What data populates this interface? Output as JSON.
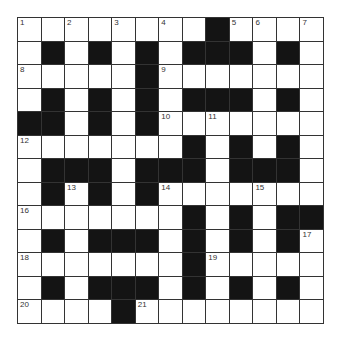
{
  "puzzle": {
    "rows": 13,
    "cols": 13,
    "grid": [
      "........#....",
      ".#.#.#.###.#.",
      ".....#.......",
      ".#.#.#.###.#.",
      "##.#.#.......",
      ".......#.#.#.",
      ".###.###.###.",
      ".#.#.#.......",
      ".......#.#.##",
      ".#.###.#.#.#.",
      ".......#.....",
      ".#.###.#.#.#.",
      "....#........"
    ],
    "numbers": [
      {
        "r": 0,
        "c": 0,
        "n": "1"
      },
      {
        "r": 0,
        "c": 2,
        "n": "2"
      },
      {
        "r": 0,
        "c": 4,
        "n": "3"
      },
      {
        "r": 0,
        "c": 6,
        "n": "4"
      },
      {
        "r": 0,
        "c": 9,
        "n": "5"
      },
      {
        "r": 0,
        "c": 10,
        "n": "6"
      },
      {
        "r": 0,
        "c": 12,
        "n": "7"
      },
      {
        "r": 2,
        "c": 0,
        "n": "8"
      },
      {
        "r": 2,
        "c": 6,
        "n": "9"
      },
      {
        "r": 4,
        "c": 6,
        "n": "10"
      },
      {
        "r": 4,
        "c": 8,
        "n": "11"
      },
      {
        "r": 5,
        "c": 0,
        "n": "12"
      },
      {
        "r": 7,
        "c": 2,
        "n": "13"
      },
      {
        "r": 7,
        "c": 6,
        "n": "14"
      },
      {
        "r": 7,
        "c": 10,
        "n": "15"
      },
      {
        "r": 8,
        "c": 0,
        "n": "16"
      },
      {
        "r": 9,
        "c": 12,
        "n": "17"
      },
      {
        "r": 10,
        "c": 0,
        "n": "18"
      },
      {
        "r": 10,
        "c": 8,
        "n": "19"
      },
      {
        "r": 12,
        "c": 0,
        "n": "20"
      },
      {
        "r": 12,
        "c": 5,
        "n": "21"
      }
    ],
    "colors": {
      "block": "#141414",
      "cell": "#ffffff",
      "gridline": "#333333",
      "number": "#333333"
    }
  }
}
